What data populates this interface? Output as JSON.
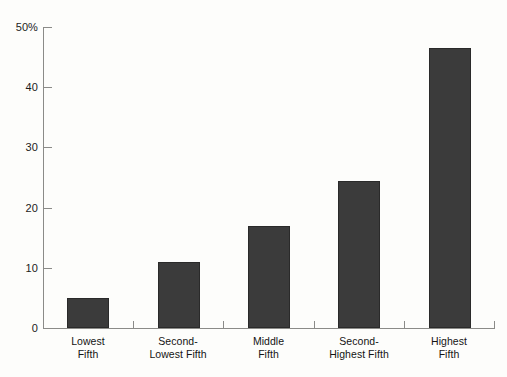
{
  "chart_data": {
    "type": "bar",
    "title": "",
    "subtitle": "",
    "xlabel": "",
    "ylabel": "",
    "categories": [
      "Lowest Fifth",
      "Second-Lowest Fifth",
      "Middle Fifth",
      "Second-Highest Fifth",
      "Highest Fifth"
    ],
    "category_lines": [
      [
        "Lowest",
        "Fifth"
      ],
      [
        "Second-",
        "Lowest Fifth"
      ],
      [
        "Middle",
        "Fifth"
      ],
      [
        "Second-",
        "Highest Fifth"
      ],
      [
        "Highest",
        "Fifth"
      ]
    ],
    "values": [
      5.0,
      11.0,
      17.0,
      24.5,
      46.5
    ],
    "ylim": [
      0,
      50
    ],
    "yticks": [
      0,
      10,
      20,
      30,
      40,
      50
    ],
    "ytick_labels": [
      "0",
      "10",
      "20",
      "30",
      "40",
      "50%"
    ],
    "grid": false,
    "legend": false,
    "legend_position": "none",
    "bar_color": "#3b3b3b",
    "axis_color": "#8b8b88",
    "text_color": "#141414",
    "background_color": "#fdfdfb"
  }
}
